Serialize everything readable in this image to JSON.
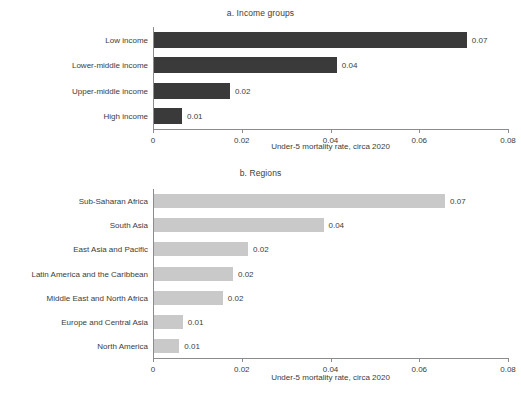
{
  "figure": {
    "axis_label": "Under-5 mortality rate, circa 2020",
    "bar_color_income": "#3a3a3a",
    "bar_color_regions": "#c9c9c9",
    "axis_color": "#8c8c8c",
    "text_color": "#3c3c3c"
  },
  "chart_data": [
    {
      "type": "bar",
      "orientation": "horizontal",
      "title": "a. Income groups",
      "xlabel": "Under-5 mortality rate, circa 2020",
      "ylabel": "",
      "xlim": [
        0,
        0.08
      ],
      "xticks": [
        0,
        0.02,
        0.04,
        0.06,
        0.08
      ],
      "xticklabels": [
        "0",
        "0.02",
        "0.04",
        "0.06",
        "0.08"
      ],
      "grid": false,
      "legend": "none",
      "bar_color": "#3a3a3a",
      "categories": [
        "Low income",
        "Lower-middle income",
        "Upper-middle income",
        "High income"
      ],
      "values": [
        0.0705,
        0.0412,
        0.0171,
        0.0063
      ],
      "data_labels": [
        "0.07",
        "0.04",
        "0.02",
        "0.01"
      ]
    },
    {
      "type": "bar",
      "orientation": "horizontal",
      "title": "b. Regions",
      "xlabel": "Under-5 mortality rate, circa 2020",
      "ylabel": "",
      "xlim": [
        0,
        0.08
      ],
      "xticks": [
        0,
        0.02,
        0.04,
        0.06,
        0.08
      ],
      "xticklabels": [
        "0",
        "0.02",
        "0.04",
        "0.06",
        "0.08"
      ],
      "grid": false,
      "legend": "none",
      "bar_color": "#c9c9c9",
      "categories": [
        "Sub-Saharan Africa",
        "South Asia",
        "East Asia and Pacific",
        "Latin America and the Caribbean",
        "Middle East and North Africa",
        "Europe and Central Asia",
        "North America"
      ],
      "values": [
        0.0656,
        0.0382,
        0.0212,
        0.0178,
        0.0155,
        0.0065,
        0.0057
      ],
      "data_labels": [
        "0.07",
        "0.04",
        "0.02",
        "0.02",
        "0.02",
        "0.01",
        "0.01"
      ]
    }
  ]
}
